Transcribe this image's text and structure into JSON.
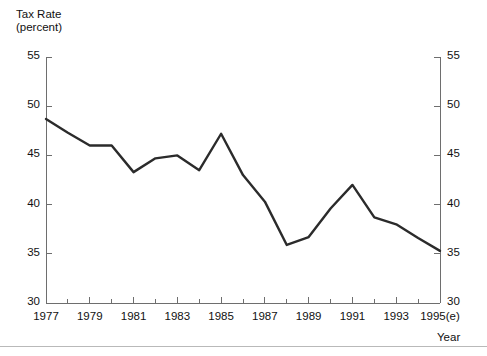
{
  "chart_data": {
    "type": "line",
    "title": "",
    "ylabel": "Tax Rate\n(percent)",
    "ylabel_line1": "Tax Rate",
    "ylabel_line2": "(percent)",
    "xlabel": "Year",
    "ylim": [
      30,
      55
    ],
    "ytick_labels": [
      "55",
      "50",
      "45",
      "40",
      "35",
      "30"
    ],
    "ytick_values": [
      55,
      50,
      45,
      40,
      35,
      30
    ],
    "ytick_labels_right": [
      "55",
      "50",
      "45",
      "40",
      "35",
      "30"
    ],
    "xtick_labels": [
      "1977",
      "1979",
      "1981",
      "1983",
      "1985",
      "1987",
      "1989",
      "1991",
      "1993",
      "1995(e)"
    ],
    "xtick_values": [
      1977,
      1979,
      1981,
      1983,
      1985,
      1987,
      1989,
      1991,
      1993,
      1995
    ],
    "minor_xtick_values": [
      1978,
      1980,
      1982,
      1984,
      1986,
      1988,
      1990,
      1992,
      1994
    ],
    "xlim": [
      1977,
      1995
    ],
    "grid": false,
    "legend": "none",
    "line_color": "#2b2b2b",
    "axis_color": "#6e6e6e",
    "categories": [
      "1977",
      "1978",
      "1979",
      "1980",
      "1981",
      "1982",
      "1983",
      "1984",
      "1985",
      "1986",
      "1987",
      "1988",
      "1989",
      "1990",
      "1991",
      "1992",
      "1993",
      "1994",
      "1995(e)"
    ],
    "x": [
      1977,
      1978,
      1979,
      1980,
      1981,
      1982,
      1983,
      1984,
      1985,
      1986,
      1987,
      1988,
      1989,
      1990,
      1991,
      1992,
      1993,
      1994,
      1995
    ],
    "values": [
      48.7,
      47.3,
      46.0,
      46.0,
      43.3,
      44.7,
      45.0,
      43.5,
      47.2,
      43.0,
      40.3,
      35.9,
      36.7,
      39.6,
      42.0,
      38.7,
      38.0,
      36.6,
      35.3
    ]
  }
}
